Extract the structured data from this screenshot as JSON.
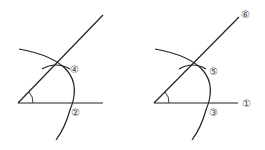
{
  "figures": [
    {
      "name": "left-construction",
      "labels": {
        "arc_intersection": "④",
        "base_intersection": "②"
      }
    },
    {
      "name": "right-construction",
      "labels": {
        "ray_end": "⑥",
        "arc_intersection": "⑤",
        "base_end": "①",
        "base_intersection": "③"
      }
    }
  ],
  "colors": {
    "stroke": "#222222",
    "label": "#444444"
  }
}
